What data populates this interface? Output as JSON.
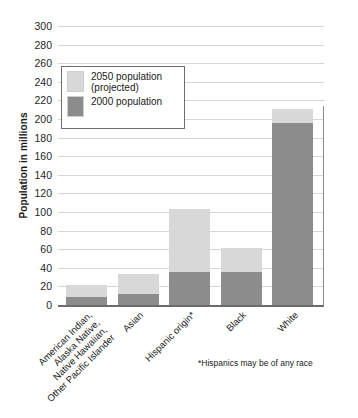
{
  "chart_data": {
    "type": "bar",
    "subtype": "stacked",
    "title": "",
    "subtitle": "",
    "xlabel": "",
    "ylabel": "Population in millions",
    "ylim": [
      0,
      300
    ],
    "ytick_step": 20,
    "yticks": [
      300,
      280,
      260,
      240,
      220,
      200,
      180,
      160,
      140,
      120,
      100,
      80,
      60,
      40,
      20,
      0
    ],
    "grid": true,
    "legend_position": "upper-left-inside",
    "categories": [
      "American Indian, Alaska Native, Native Hawaiian, Other Pacific Islander",
      "Asian",
      "Hispanic origin*",
      "Black",
      "White"
    ],
    "category_lines": [
      [
        "American Indian,",
        "Alaska Native,",
        "Native Hawaiian,",
        "Other Pacific Islander"
      ],
      [
        "Asian"
      ],
      [
        "Hispanic origin*"
      ],
      [
        "Black"
      ],
      [
        "White"
      ]
    ],
    "series": [
      {
        "name": "2000 population",
        "color": "#8c8c8c",
        "values": [
          9,
          12,
          36,
          36,
          196
        ]
      },
      {
        "name": "2050 population (projected)",
        "color": "#d8d8d8",
        "values": [
          22,
          33,
          103,
          61,
          211
        ]
      }
    ],
    "annotations": [
      "*Hispanics may be of any race"
    ]
  },
  "legend": {
    "items": [
      {
        "label_line1": "2050 population",
        "label_line2": "(projected)",
        "color": "#d8d8d8",
        "swatch_name": "legend-swatch-projected"
      },
      {
        "label_line1": "2000 population",
        "label_line2": "",
        "color": "#8c8c8c",
        "swatch_name": "legend-swatch-base"
      }
    ]
  },
  "axis": {
    "y_title": "Population in millions",
    "y_labels": [
      "300",
      "280",
      "260",
      "240",
      "220",
      "200",
      "180",
      "160",
      "140",
      "120",
      "100",
      "80",
      "60",
      "40",
      "20",
      "0"
    ]
  },
  "footnote": {
    "text": "*Hispanics may be of any race"
  },
  "colors": {
    "projected": "#d8d8d8",
    "base": "#8c8c8c",
    "grid": "#d6d6d6",
    "axis": "#6b6b6b",
    "text": "#1a1a1a",
    "background": "#ffffff"
  }
}
